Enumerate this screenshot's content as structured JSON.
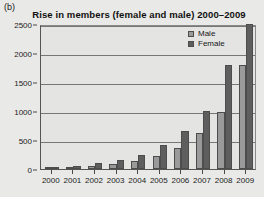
{
  "panel_label": "(b)",
  "legend": {
    "position": "top-right",
    "entries": [
      {
        "label": "Male",
        "color": "#9a9a9a"
      },
      {
        "label": "Female",
        "color": "#5e5e5e"
      }
    ]
  },
  "chart_data": {
    "type": "bar",
    "title": "Rise in members (female and male) 2000–2009",
    "xlabel": "",
    "ylabel": "",
    "categories": [
      "2000",
      "2001",
      "2002",
      "2003",
      "2004",
      "2005",
      "2006",
      "2007",
      "2008",
      "2009"
    ],
    "series": [
      {
        "name": "Male",
        "color": "#9a9a9a",
        "values": [
          20,
          40,
          60,
          90,
          130,
          220,
          360,
          620,
          980,
          1800
        ]
      },
      {
        "name": "Female",
        "color": "#5e5e5e",
        "values": [
          30,
          60,
          100,
          150,
          250,
          420,
          650,
          1000,
          1800,
          2500
        ]
      }
    ],
    "ylim": [
      0,
      2500
    ],
    "yticks": [
      0,
      500,
      1000,
      1500,
      2000,
      2500
    ],
    "ytick_labels": [
      "0",
      "500",
      "1000",
      "1500",
      "2000",
      "2500"
    ],
    "grid": true,
    "grid_axis": "y"
  }
}
